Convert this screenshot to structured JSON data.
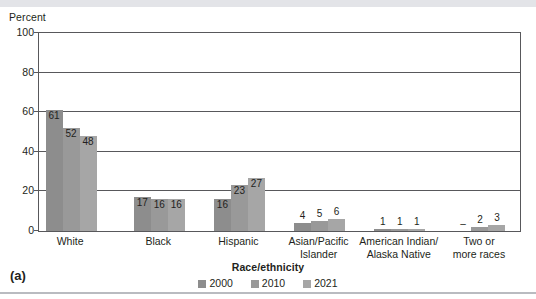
{
  "panel": {
    "label": "(a)"
  },
  "chart_data": {
    "type": "bar",
    "title": "",
    "ylabel": "Percent",
    "xlabel": "Race/ethnicity",
    "ylim": [
      0,
      100
    ],
    "yticks": [
      0,
      20,
      40,
      60,
      80,
      100
    ],
    "grid": true,
    "legend_position": "bottom",
    "categories": [
      "White",
      "Black",
      "Hispanic",
      "Asian/Pacific Islander",
      "American Indian/ Alaska Native",
      "Two or more races"
    ],
    "category_lines": [
      [
        "White"
      ],
      [
        "Black"
      ],
      [
        "Hispanic"
      ],
      [
        "Asian/Pacific",
        "Islander"
      ],
      [
        "American Indian/",
        "Alaska Native"
      ],
      [
        "Two or",
        "more races"
      ]
    ],
    "series": [
      {
        "name": "2000",
        "color": "#8d8d8d",
        "values": [
          61,
          17,
          16,
          4,
          1,
          null
        ],
        "labels": [
          "61",
          "17",
          "16",
          "4",
          "1",
          "–"
        ]
      },
      {
        "name": "2010",
        "color": "#999999",
        "values": [
          52,
          16,
          23,
          5,
          1,
          2
        ],
        "labels": [
          "52",
          "16",
          "23",
          "5",
          "1",
          "2"
        ]
      },
      {
        "name": "2021",
        "color": "#a6a6a6",
        "values": [
          48,
          16,
          27,
          6,
          1,
          3
        ],
        "labels": [
          "48",
          "16",
          "27",
          "6",
          "1",
          "3"
        ]
      }
    ]
  },
  "colors": {
    "axis": "#58585b",
    "text": "#231f20",
    "top_band": "#e3e4e8",
    "bottom_rule": "#b9bbc0"
  }
}
